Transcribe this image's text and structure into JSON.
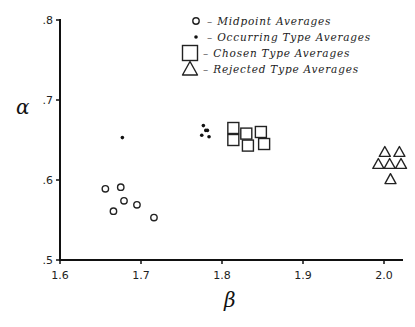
{
  "chart_data": {
    "type": "scatter",
    "title": "",
    "xlabel": "β",
    "ylabel": "α",
    "xlim": [
      1.6,
      2.025
    ],
    "ylim": [
      0.5,
      0.8
    ],
    "xticks": [
      1.6,
      1.7,
      1.8,
      1.9,
      2.0
    ],
    "xtick_labels": [
      "1.6",
      "1.7",
      "1.8",
      "1.9",
      "2.0"
    ],
    "yticks": [
      0.5,
      0.6,
      0.7,
      0.8
    ],
    "ytick_labels": [
      ".5",
      ".6",
      ".7",
      ".8"
    ],
    "grid": false,
    "legend_position": "upper center",
    "series": [
      {
        "name": "Midpoint Averages",
        "marker": "open-circle",
        "points": [
          [
            1.656,
            0.589
          ],
          [
            1.675,
            0.591
          ],
          [
            1.679,
            0.574
          ],
          [
            1.666,
            0.561
          ],
          [
            1.695,
            0.569
          ],
          [
            1.716,
            0.553
          ]
        ]
      },
      {
        "name": "Occurring Type Averages",
        "marker": "dot",
        "points": [
          [
            1.677,
            0.653
          ],
          [
            1.777,
            0.668
          ],
          [
            1.782,
            0.662
          ],
          [
            1.775,
            0.656
          ],
          [
            1.784,
            0.654
          ],
          [
            1.78,
            0.662
          ]
        ]
      },
      {
        "name": "Chosen Type Averages",
        "marker": "open-square",
        "points": [
          [
            1.814,
            0.665
          ],
          [
            1.814,
            0.65
          ],
          [
            1.83,
            0.658
          ],
          [
            1.832,
            0.643
          ],
          [
            1.848,
            0.66
          ],
          [
            1.852,
            0.645
          ]
        ]
      },
      {
        "name": "Rejected Type Averages",
        "marker": "open-triangle",
        "points": [
          [
            2.001,
            0.635
          ],
          [
            2.019,
            0.635
          ],
          [
            1.993,
            0.62
          ],
          [
            2.007,
            0.62
          ],
          [
            2.021,
            0.62
          ],
          [
            2.008,
            0.601
          ]
        ]
      }
    ]
  },
  "legend": [
    {
      "label": "Midpoint Averages",
      "dash": "–"
    },
    {
      "label": "Occurring Type Averages",
      "dash": "–"
    },
    {
      "label": "Chosen Type Averages",
      "dash": "–"
    },
    {
      "label": "Rejected Type Averages",
      "dash": "–"
    }
  ]
}
